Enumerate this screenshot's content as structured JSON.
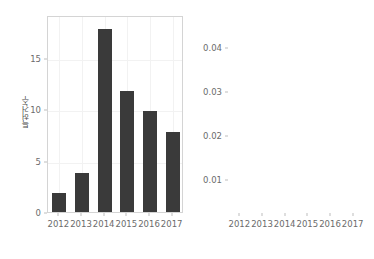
{
  "chart_data": [
    {
      "type": "bar",
      "title": "",
      "xlabel": "",
      "ylabel": "특허건수",
      "categories": [
        "2012",
        "2013",
        "2014",
        "2015",
        "2016",
        "2017"
      ],
      "values": [
        2,
        4,
        18,
        12,
        10,
        8
      ],
      "yticks": [
        0,
        5,
        10,
        15
      ],
      "ytick_labels": [
        "0",
        "5",
        "10",
        "15"
      ],
      "ylim": [
        0,
        19.2
      ],
      "grid": true,
      "legend": "none",
      "bar_color": "#3a3a3a",
      "panel_border_color": "#d4d4d4",
      "gridline_color": "#f2f2f2",
      "tick_label_color": "#6b6b6b",
      "axis_title_color": "#4d4d4d"
    },
    {
      "type": "line",
      "title": "",
      "xlabel": "",
      "ylabel": "위험률",
      "categories": [
        "2012",
        "2013",
        "2014",
        "2015",
        "2016",
        "2017"
      ],
      "values": [
        0.0045,
        0.018,
        0.043,
        0.045,
        0.034,
        0.0275
      ],
      "yticks": [
        0.01,
        0.02,
        0.03,
        0.04
      ],
      "ytick_labels": [
        "0.01",
        "0.02",
        "0.03",
        "0.04"
      ],
      "ylim": [
        0.0025,
        0.0472
      ],
      "grid": true,
      "legend": "none",
      "line_color": "#4a4a4a",
      "panel_border_color": "#d4d4d4",
      "gridline_color": "#f2f2f2",
      "tick_label_color": "#6b6b6b",
      "axis_title_color": "#4d4d4d"
    }
  ]
}
